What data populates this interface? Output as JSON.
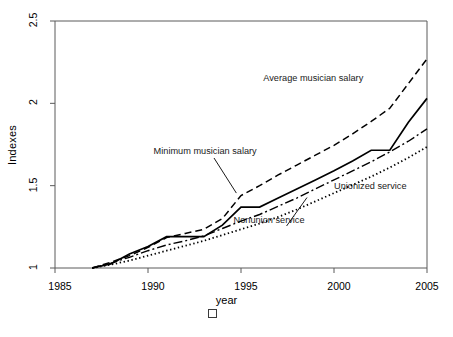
{
  "chart_data": {
    "type": "line",
    "title": "",
    "xlabel": "year",
    "ylabel": "Indexes",
    "xlim": [
      1985,
      2005
    ],
    "ylim": [
      1,
      2.5
    ],
    "xticks": [
      1985,
      1990,
      1995,
      2000,
      2005
    ],
    "yticks": [
      "1",
      "1.5",
      "2",
      "2.5"
    ],
    "grid": false,
    "legend_position": "inline-annotations",
    "x": [
      1987,
      1988,
      1989,
      1990,
      1991,
      1992,
      1993,
      1994,
      1995,
      1996,
      1997,
      1998,
      1999,
      2000,
      2001,
      2002,
      2003,
      2004,
      2005
    ],
    "series": [
      {
        "name": "Average musician salary",
        "style": "dashed",
        "values": [
          1.0,
          1.035,
          1.075,
          1.125,
          1.185,
          1.21,
          1.235,
          1.3,
          1.44,
          1.5,
          1.565,
          1.625,
          1.685,
          1.745,
          1.815,
          1.89,
          1.97,
          2.12,
          2.27
        ]
      },
      {
        "name": "Minimum musician salary",
        "style": "solid",
        "values": [
          1.0,
          1.025,
          1.085,
          1.13,
          1.19,
          1.19,
          1.19,
          1.26,
          1.37,
          1.37,
          1.425,
          1.48,
          1.535,
          1.59,
          1.65,
          1.715,
          1.715,
          1.885,
          2.03
        ]
      },
      {
        "name": "Unionized service",
        "style": "dashdot",
        "values": [
          1.0,
          1.03,
          1.065,
          1.105,
          1.14,
          1.165,
          1.195,
          1.24,
          1.285,
          1.325,
          1.375,
          1.425,
          1.48,
          1.535,
          1.59,
          1.645,
          1.705,
          1.77,
          1.845
        ]
      },
      {
        "name": "Nonunion service",
        "style": "dotted",
        "values": [
          1.0,
          1.02,
          1.045,
          1.075,
          1.105,
          1.135,
          1.165,
          1.2,
          1.235,
          1.27,
          1.31,
          1.355,
          1.405,
          1.455,
          1.505,
          1.555,
          1.61,
          1.67,
          1.735
        ]
      }
    ],
    "annotations": [
      {
        "text": "Average musician salary",
        "x": 1996.2,
        "y": 2.145
      },
      {
        "text": "Minimum musician salary",
        "x": 1990.3,
        "y": 1.705
      },
      {
        "text": "Unionized service",
        "x": 2000.0,
        "y": 1.49
      },
      {
        "text": "Nonunion service",
        "x": 1994.6,
        "y": 1.285
      }
    ],
    "marker": {
      "shape": "square",
      "filled": false
    }
  },
  "axis": {
    "y_title": "Indexes",
    "x_title": "year",
    "y_tick_labels": [
      "2.5",
      "2",
      "1.5",
      "1"
    ],
    "x_tick_labels": [
      "1985",
      "1990",
      "1995",
      "2000",
      "2005"
    ]
  },
  "colors": {
    "line": "#000000",
    "axis": "#5a5a5a",
    "text": "#000000",
    "background": "#ffffff"
  }
}
